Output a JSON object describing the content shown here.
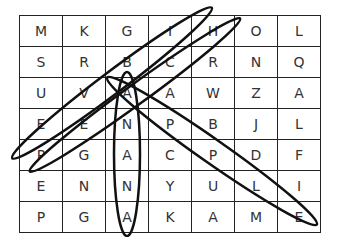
{
  "puzzle": {
    "grid": [
      [
        "M",
        "K",
        "G",
        "I",
        "H",
        "O",
        "L"
      ],
      [
        "S",
        "R",
        "B",
        "C",
        "R",
        "N",
        "Q"
      ],
      [
        "U",
        "V",
        "A",
        "A",
        "W",
        "Z",
        "A"
      ],
      [
        "E",
        "E",
        "N",
        "P",
        "B",
        "J",
        "L"
      ],
      [
        "P",
        "G",
        "A",
        "C",
        "P",
        "D",
        "F"
      ],
      [
        "E",
        "N",
        "N",
        "Y",
        "U",
        "L",
        "I"
      ],
      [
        "P",
        "G",
        "A",
        "K",
        "A",
        "M",
        "E"
      ]
    ],
    "circled_words": [
      {
        "start": [
          1,
          2
        ],
        "end": [
          6,
          2
        ],
        "direction": "vertical"
      },
      {
        "start": [
          4,
          0
        ],
        "end": [
          0,
          4
        ],
        "direction": "diagonal-up"
      },
      {
        "start": [
          5,
          0
        ],
        "end": [
          0,
          5
        ],
        "direction": "diagonal-up"
      },
      {
        "start": [
          2,
          2
        ],
        "end": [
          6,
          6
        ],
        "direction": "diagonal-down"
      }
    ],
    "line_color": "#111111"
  }
}
